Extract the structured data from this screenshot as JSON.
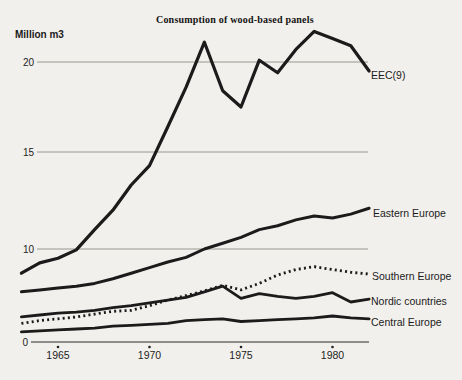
{
  "page": {
    "title": "Consumption of wood-based panels",
    "y_axis_unit": "Million m3"
  },
  "axes": {
    "y_tick_labels": [
      "20",
      "15",
      "10"
    ],
    "y_origin_label": "0",
    "x_tick_labels": [
      "1965",
      "1970",
      "1975",
      "1980"
    ]
  },
  "colors": {
    "paper": "#f2f0ec",
    "ink": "#1b1b1b",
    "grid": "#8f8d89",
    "axis": "#2a2a2a"
  },
  "chart_data": {
    "type": "line",
    "title": "Consumption of wood-based panels",
    "xlabel": "",
    "ylabel": "Million m3",
    "xlim": [
      1963,
      1982
    ],
    "ylim": [
      0,
      22
    ],
    "grid": "horizontal-only",
    "y_gridlines": [
      10,
      15,
      20
    ],
    "x_ticks": [
      1965,
      1970,
      1975,
      1980
    ],
    "legend_position": "labels-at-line-ends",
    "x": [
      1963,
      1964,
      1965,
      1966,
      1967,
      1968,
      1969,
      1970,
      1971,
      1972,
      1973,
      1974,
      1975,
      1976,
      1977,
      1978,
      1979,
      1980,
      1981,
      1982
    ],
    "series": [
      {
        "name": "EEC(9)",
        "style": "solid",
        "values": [
          7.4,
          8.5,
          9.0,
          9.9,
          11.0,
          12.0,
          13.3,
          14.3,
          16.4,
          18.6,
          21.1,
          18.4,
          17.5,
          20.1,
          19.4,
          20.7,
          21.7,
          21.3,
          20.9,
          19.5
        ]
      },
      {
        "name": "Eastern Europe",
        "style": "solid",
        "values": [
          5.4,
          5.6,
          5.8,
          6.0,
          6.3,
          6.8,
          7.4,
          8.0,
          8.6,
          9.1,
          10.0,
          10.3,
          10.6,
          11.0,
          11.2,
          11.5,
          11.7,
          11.6,
          11.8,
          12.1
        ]
      },
      {
        "name": "Southern Europe",
        "style": "dotted",
        "values": [
          2.0,
          2.3,
          2.5,
          2.7,
          3.0,
          3.3,
          3.4,
          3.9,
          4.5,
          5.0,
          5.5,
          6.1,
          5.6,
          6.3,
          7.2,
          7.8,
          8.1,
          7.8,
          7.5,
          7.3
        ]
      },
      {
        "name": "Nordic countries",
        "style": "solid",
        "values": [
          2.7,
          2.9,
          3.1,
          3.2,
          3.4,
          3.7,
          3.9,
          4.2,
          4.5,
          4.8,
          5.4,
          6.0,
          4.7,
          5.2,
          4.9,
          4.7,
          4.9,
          5.3,
          4.3,
          4.6
        ]
      },
      {
        "name": "Central Europe",
        "style": "solid",
        "values": [
          1.1,
          1.2,
          1.3,
          1.4,
          1.5,
          1.7,
          1.8,
          1.9,
          2.0,
          2.3,
          2.4,
          2.5,
          2.2,
          2.3,
          2.4,
          2.5,
          2.6,
          2.8,
          2.6,
          2.5
        ]
      }
    ]
  }
}
